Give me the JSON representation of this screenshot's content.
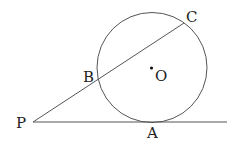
{
  "diagram": {
    "type": "geometry",
    "stroke_color": "#555555",
    "circle": {
      "center_label": "O",
      "cx": 152,
      "cy": 67.5,
      "r": 55
    },
    "points": {
      "P": {
        "label": "P",
        "x": 33,
        "y": 122
      },
      "A": {
        "label": "A",
        "x": 152,
        "y": 122
      },
      "B": {
        "label": "B",
        "x": 97,
        "y": 79
      },
      "C": {
        "label": "C",
        "x": 184,
        "y": 23
      },
      "O": {
        "label": "O",
        "x": 152,
        "y": 68
      }
    },
    "segments": [
      {
        "name": "tangent-PA",
        "from": "P",
        "to_x": 227,
        "to_y": 122
      },
      {
        "name": "secant-PC",
        "from": "P",
        "to": "C"
      }
    ],
    "labels": {
      "P": "P",
      "A": "A",
      "B": "B",
      "C": "C",
      "O": "O"
    }
  }
}
